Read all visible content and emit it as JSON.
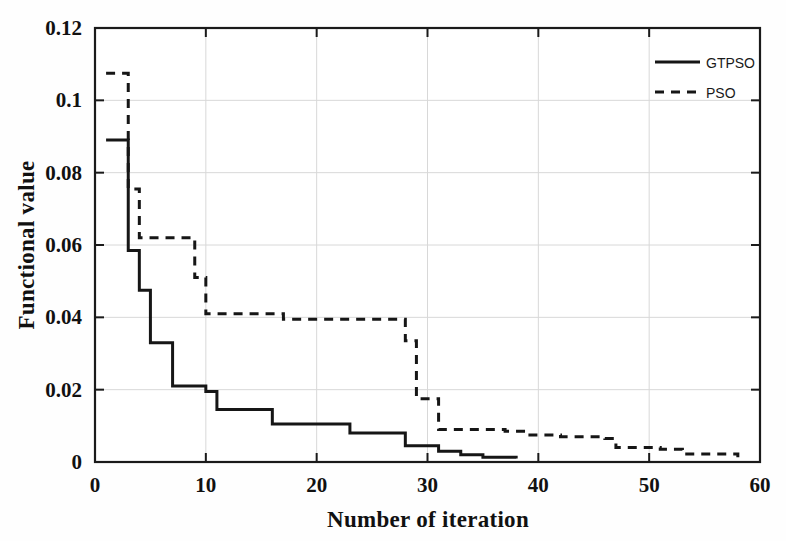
{
  "chart_data": {
    "type": "line",
    "title": "",
    "subtitle": "",
    "xlabel": "Number of iteration",
    "ylabel": "Functional value",
    "xlim": [
      0,
      60
    ],
    "ylim": [
      0,
      0.12
    ],
    "xticks": [
      0,
      10,
      20,
      30,
      40,
      50,
      60
    ],
    "xtick_labels": [
      "0",
      "10",
      "20",
      "30",
      "40",
      "50",
      "60"
    ],
    "yticks": [
      0,
      0.02,
      0.04,
      0.06,
      0.08,
      0.1,
      0.12
    ],
    "ytick_labels": [
      "0",
      "0.02",
      "0.04",
      "0.06",
      "0.08",
      "0.1",
      "0.12"
    ],
    "grid": true,
    "legend_position": "top-right",
    "drawstyle": "steps-post",
    "series": [
      {
        "name": "GTPSO",
        "style": "solid",
        "color": "#161616",
        "x": [
          1,
          2,
          3,
          4,
          5,
          7,
          10,
          11,
          16,
          23,
          28,
          31,
          33,
          35,
          38
        ],
        "y": [
          0.089,
          0.089,
          0.0585,
          0.0475,
          0.033,
          0.021,
          0.0195,
          0.0145,
          0.0105,
          0.008,
          0.0045,
          0.003,
          0.002,
          0.0013,
          0.001
        ]
      },
      {
        "name": "PSO",
        "style": "dashed",
        "color": "#161616",
        "x": [
          1,
          2,
          3,
          4,
          6,
          9,
          10,
          14,
          17,
          23,
          28,
          29,
          31,
          37,
          39,
          42,
          46,
          47,
          51,
          53,
          58
        ],
        "y": [
          0.1075,
          0.1075,
          0.0755,
          0.062,
          0.062,
          0.051,
          0.041,
          0.041,
          0.0395,
          0.0395,
          0.0335,
          0.0175,
          0.009,
          0.0085,
          0.0075,
          0.007,
          0.0065,
          0.004,
          0.0035,
          0.0022,
          0.0013
        ]
      }
    ]
  },
  "legend": {
    "items": [
      {
        "label": "GTPSO",
        "style": "solid"
      },
      {
        "label": "PSO",
        "style": "dashed"
      }
    ]
  }
}
